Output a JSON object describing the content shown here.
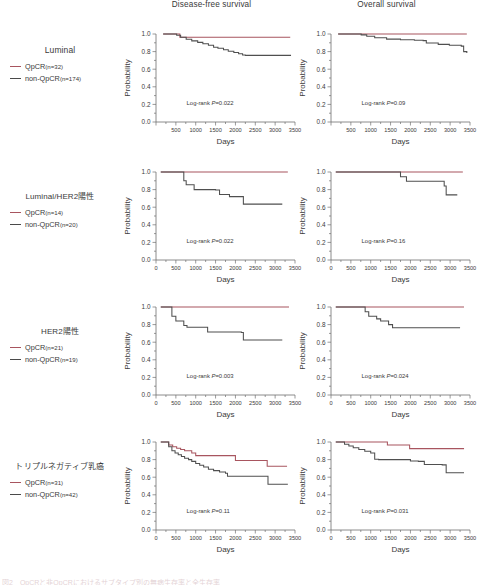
{
  "figure": {
    "column_titles": [
      "Disease-free survival",
      "Overall survival"
    ],
    "axis": {
      "xlabel": "Days",
      "ylabel": "Probability",
      "xlim": [
        0,
        3500
      ],
      "ylim": [
        0,
        1.0
      ],
      "xticks": [
        0,
        500,
        1000,
        1500,
        2000,
        2500,
        3000,
        3500
      ],
      "xticklabels": [
        "0",
        "500",
        "1000",
        "1500",
        "2000",
        "2500",
        "3000",
        "3500"
      ],
      "yticks": [
        0.0,
        0.2,
        0.4,
        0.6,
        0.8,
        1.0
      ],
      "yticklabels": [
        "0.0",
        "0.2",
        "0.4",
        "0.6",
        "0.8",
        "1.0"
      ],
      "minor_x_interval": 250,
      "minor_y_interval": 0.1,
      "grid": false
    },
    "legend_series": [
      {
        "key": "qpcr",
        "label": "QpCR",
        "color": "#a8555f"
      },
      {
        "key": "non_qpcr",
        "label": "non-QpCR",
        "color": "#4f4f4f"
      }
    ],
    "logrank_prefix": "Log-rank",
    "pvalue_symbol": "P",
    "caption": "図2　QpCRと非QpCRにおけるサブタイプ別の無病生存率と全生存率"
  },
  "chart_data": [
    {
      "type": "line",
      "group": "Luminal",
      "panel": "Disease-free survival",
      "title": "Disease-free survival",
      "xlabel": "Days",
      "ylabel": "Probability",
      "xlim": [
        0,
        3500
      ],
      "ylim": [
        0,
        1.0
      ],
      "legend_title": "Luminal",
      "annotation": "Log-rank  P=0.022",
      "pvalue": 0.022,
      "x_tick_zero_shown": false,
      "series": [
        {
          "name": "QpCR",
          "n": 32,
          "label": "QpCR(n=32)",
          "color": "#a8555f",
          "x": [
            180,
            560,
            600,
            3380
          ],
          "y": [
            1.0,
            1.0,
            0.962,
            0.962
          ]
        },
        {
          "name": "non-QpCR",
          "n": 174,
          "label": "non-QpCR (n=174)",
          "color": "#4f4f4f",
          "x": [
            180,
            520,
            620,
            760,
            900,
            1050,
            1180,
            1320,
            1450,
            1560,
            1700,
            1820,
            1960,
            2080,
            2180,
            2250,
            3400
          ],
          "y": [
            1.0,
            0.985,
            0.962,
            0.94,
            0.922,
            0.905,
            0.89,
            0.872,
            0.85,
            0.838,
            0.822,
            0.805,
            0.79,
            0.775,
            0.762,
            0.757,
            0.757
          ]
        }
      ]
    },
    {
      "type": "line",
      "group": "Luminal",
      "panel": "Overall survival",
      "title": "Overall survival",
      "xlabel": "Days",
      "ylabel": "Probability",
      "xlim": [
        0,
        3500
      ],
      "ylim": [
        0,
        1.0
      ],
      "legend_title": "Luminal",
      "annotation": "Log-rank  P=0.09",
      "pvalue": 0.09,
      "x_tick_zero_shown": false,
      "series": [
        {
          "name": "QpCR",
          "n": 32,
          "label": "QpCR(n=32)",
          "color": "#a8555f",
          "x": [
            180,
            3420
          ],
          "y": [
            1.0,
            1.0
          ]
        },
        {
          "name": "non-QpCR",
          "n": 174,
          "label": "non-QpCR (n=174)",
          "color": "#4f4f4f",
          "x": [
            180,
            760,
            900,
            1100,
            1400,
            1750,
            2100,
            2320,
            2400,
            2700,
            2980,
            3280,
            3340,
            3420
          ],
          "y": [
            1.0,
            0.99,
            0.975,
            0.958,
            0.942,
            0.935,
            0.93,
            0.925,
            0.898,
            0.882,
            0.872,
            0.862,
            0.8,
            0.785
          ]
        }
      ]
    },
    {
      "type": "line",
      "group": "Luminal/HER2陽性",
      "panel": "Disease-free survival",
      "title": "Disease-free survival",
      "xlabel": "Days",
      "ylabel": "Probability",
      "xlim": [
        0,
        3500
      ],
      "ylim": [
        0,
        1.0
      ],
      "legend_title": "Luminal/HER2陽性",
      "annotation": "Log-rank  P=0.022",
      "pvalue": 0.022,
      "x_tick_zero_shown": true,
      "series": [
        {
          "name": "QpCR",
          "n": 14,
          "label": "QpCR(n=14)",
          "color": "#a8555f",
          "x": [
            120,
            3320
          ],
          "y": [
            1.0,
            1.0
          ]
        },
        {
          "name": "non-QpCR",
          "n": 20,
          "label": "non-QpCR (n=20)",
          "color": "#4f4f4f",
          "x": [
            120,
            660,
            700,
            760,
            880,
            960,
            1150,
            1500,
            1600,
            1800,
            1850,
            2150,
            2200,
            3180
          ],
          "y": [
            1.0,
            1.0,
            0.9,
            0.855,
            0.855,
            0.8,
            0.8,
            0.795,
            0.745,
            0.745,
            0.72,
            0.72,
            0.635,
            0.635
          ]
        }
      ]
    },
    {
      "type": "line",
      "group": "Luminal/HER2陽性",
      "panel": "Overall survival",
      "title": "Overall survival",
      "xlabel": "Days",
      "ylabel": "Probability",
      "xlim": [
        0,
        3500
      ],
      "ylim": [
        0,
        1.0
      ],
      "legend_title": "Luminal/HER2陽性",
      "annotation": "Log-rank  P=0.16",
      "pvalue": 0.16,
      "x_tick_zero_shown": true,
      "series": [
        {
          "name": "QpCR",
          "n": 14,
          "label": "QpCR(n=14)",
          "color": "#a8555f",
          "x": [
            120,
            3320
          ],
          "y": [
            1.0,
            1.0
          ]
        },
        {
          "name": "non-QpCR",
          "n": 20,
          "label": "non-QpCR (n=20)",
          "color": "#4f4f4f",
          "x": [
            120,
            1680,
            1750,
            1820,
            1900,
            2800,
            2850,
            2900,
            3180
          ],
          "y": [
            1.0,
            1.0,
            0.945,
            0.945,
            0.895,
            0.895,
            0.84,
            0.74,
            0.74
          ]
        }
      ]
    },
    {
      "type": "line",
      "group": "HER2陽性",
      "panel": "Disease-free survival",
      "title": "Disease-free survival",
      "xlabel": "Days",
      "ylabel": "Probability",
      "xlim": [
        0,
        3500
      ],
      "ylim": [
        0,
        1.0
      ],
      "legend_title": "HER2陽性",
      "annotation": "Log-rank  P=0.003",
      "pvalue": 0.003,
      "x_tick_zero_shown": true,
      "series": [
        {
          "name": "QpCR",
          "n": 21,
          "label": "QpCR(n=21)",
          "color": "#a8555f",
          "x": [
            120,
            3350
          ],
          "y": [
            1.0,
            1.0
          ]
        },
        {
          "name": "non-QpCR",
          "n": 19,
          "label": "non-QpCR (n=19)",
          "color": "#4f4f4f",
          "x": [
            120,
            340,
            400,
            500,
            620,
            700,
            780,
            1250,
            1300,
            2050,
            2150,
            2200,
            3180
          ],
          "y": [
            1.0,
            1.0,
            0.895,
            0.84,
            0.84,
            0.79,
            0.77,
            0.77,
            0.715,
            0.715,
            0.71,
            0.625,
            0.625
          ]
        }
      ]
    },
    {
      "type": "line",
      "group": "HER2陽性",
      "panel": "Overall survival",
      "title": "Overall survival",
      "xlabel": "Days",
      "ylabel": "Probability",
      "xlim": [
        0,
        3500
      ],
      "ylim": [
        0,
        1.0
      ],
      "legend_title": "HER2陽性",
      "annotation": "Log-rank  P=0.024",
      "pvalue": 0.024,
      "x_tick_zero_shown": true,
      "series": [
        {
          "name": "QpCR",
          "n": 21,
          "label": "QpCR(n=21)",
          "color": "#a8555f",
          "x": [
            120,
            3350
          ],
          "y": [
            1.0,
            1.0
          ]
        },
        {
          "name": "non-QpCR",
          "n": 19,
          "label": "non-QpCR (n=19)",
          "color": "#4f4f4f",
          "x": [
            120,
            800,
            860,
            950,
            1050,
            1150,
            1250,
            1350,
            1450,
            1550,
            3250
          ],
          "y": [
            1.0,
            1.0,
            0.945,
            0.895,
            0.895,
            0.865,
            0.84,
            0.84,
            0.8,
            0.765,
            0.765
          ]
        }
      ]
    },
    {
      "type": "line",
      "group": "トリプルネガティブ乳癌",
      "panel": "Disease-free survival",
      "title": "Disease-free survival",
      "xlabel": "Days",
      "ylabel": "Probability",
      "xlim": [
        0,
        3500
      ],
      "ylim": [
        0,
        1.0
      ],
      "legend_title": "トリプルネガティブ乳癌",
      "annotation": "Log-rank  P=0.11",
      "pvalue": 0.11,
      "x_tick_zero_shown": true,
      "series": [
        {
          "name": "QpCR",
          "n": 31,
          "label": "QpCR(n=31)",
          "color": "#a8555f",
          "x": [
            120,
            260,
            320,
            420,
            520,
            620,
            720,
            900,
            1000,
            1900,
            2000,
            2750,
            2800,
            3300
          ],
          "y": [
            1.0,
            1.0,
            0.965,
            0.945,
            0.93,
            0.915,
            0.9,
            0.875,
            0.845,
            0.845,
            0.79,
            0.79,
            0.725,
            0.725
          ]
        },
        {
          "name": "non-QpCR",
          "n": 42,
          "label": "non-QpCR (n=42)",
          "color": "#4f4f4f",
          "x": [
            120,
            250,
            320,
            400,
            480,
            560,
            640,
            720,
            820,
            900,
            1000,
            1100,
            1200,
            1320,
            1450,
            1600,
            1750,
            1800,
            2750,
            2820,
            3320
          ],
          "y": [
            1.0,
            1.0,
            0.945,
            0.9,
            0.875,
            0.855,
            0.835,
            0.815,
            0.8,
            0.78,
            0.755,
            0.735,
            0.715,
            0.69,
            0.675,
            0.66,
            0.645,
            0.61,
            0.61,
            0.52,
            0.52
          ]
        }
      ]
    },
    {
      "type": "line",
      "group": "トリプルネガティブ乳癌",
      "panel": "Overall survival",
      "title": "Overall survival",
      "xlabel": "Days",
      "ylabel": "Probability",
      "xlim": [
        0,
        3500
      ],
      "ylim": [
        0,
        1.0
      ],
      "legend_title": "トリプルネガティブ乳癌",
      "annotation": "Log-rank  P=0.031",
      "pvalue": 0.031,
      "x_tick_zero_shown": true,
      "series": [
        {
          "name": "QpCR",
          "n": 31,
          "label": "QpCR(n=31)",
          "color": "#a8555f",
          "x": [
            120,
            1350,
            1420,
            1900,
            1980,
            3350
          ],
          "y": [
            1.0,
            1.0,
            0.965,
            0.965,
            0.925,
            0.925
          ]
        },
        {
          "name": "non-QpCR",
          "n": 42,
          "label": "non-QpCR (n=42)",
          "color": "#4f4f4f",
          "x": [
            120,
            260,
            340,
            450,
            560,
            700,
            850,
            1000,
            1100,
            1200,
            1500,
            1800,
            2000,
            2200,
            2350,
            2450,
            2800,
            2900,
            3350
          ],
          "y": [
            1.0,
            1.0,
            0.975,
            0.955,
            0.935,
            0.915,
            0.895,
            0.875,
            0.805,
            0.8,
            0.8,
            0.8,
            0.785,
            0.78,
            0.745,
            0.745,
            0.74,
            0.65,
            0.65
          ]
        }
      ]
    }
  ],
  "rows": [
    {
      "legend_title": "Luminal",
      "is_japanese": false,
      "series": [
        {
          "label": "QpCR",
          "n_text": "(n=32)",
          "color": "#a8555f"
        },
        {
          "label": "non-QpCR",
          "n_text": " (n=174)",
          "color": "#4f4f4f"
        }
      ]
    },
    {
      "legend_title": "Luminal/HER2陽性",
      "is_japanese": true,
      "series": [
        {
          "label": "QpCR",
          "n_text": "(n=14)",
          "color": "#a8555f"
        },
        {
          "label": "non-QpCR",
          "n_text": " (n=20)",
          "color": "#4f4f4f"
        }
      ]
    },
    {
      "legend_title": "HER2陽性",
      "is_japanese": true,
      "series": [
        {
          "label": "QpCR",
          "n_text": "(n=21)",
          "color": "#a8555f"
        },
        {
          "label": "non-QpCR",
          "n_text": " (n=19)",
          "color": "#4f4f4f"
        }
      ]
    },
    {
      "legend_title": "トリプルネガティブ乳癌",
      "is_japanese": true,
      "series": [
        {
          "label": "QpCR",
          "n_text": "(n=31)",
          "color": "#a8555f"
        },
        {
          "label": "non-QpCR",
          "n_text": " (n=42)",
          "color": "#4f4f4f"
        }
      ]
    }
  ]
}
